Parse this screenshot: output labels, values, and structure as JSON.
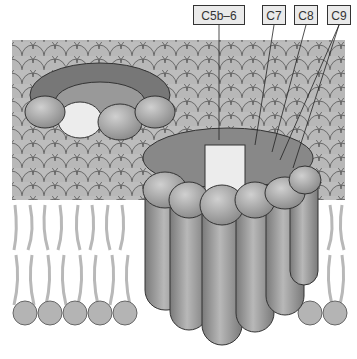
{
  "diagram": {
    "labels": [
      {
        "id": "c5b6",
        "text": "C5b–6",
        "x": 253,
        "w": 52
      },
      {
        "id": "c7",
        "text": "C7",
        "x": 262,
        "w": 24
      },
      {
        "id": "c8",
        "text": "C8",
        "x": 294,
        "w": 24
      },
      {
        "id": "c9",
        "text": "C9",
        "x": 327,
        "w": 24
      }
    ],
    "colors": {
      "membrane_head": "#b4b4b4",
      "protein": "#9a9a9a",
      "protein_light": "#e8e8e8",
      "outline": "#333333",
      "tail": "#b8b8b8"
    }
  }
}
